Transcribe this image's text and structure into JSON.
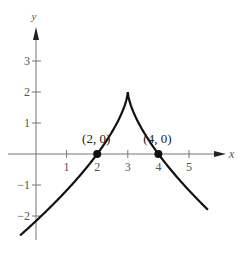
{
  "chart_data": {
    "type": "line",
    "title": "",
    "xlabel": "x",
    "ylabel": "y",
    "xlim": [
      -0.8,
      6.2
    ],
    "ylim": [
      -2.8,
      4
    ],
    "grid": false,
    "x_ticks": [
      1,
      2,
      3,
      4,
      5
    ],
    "x_tick_labels": [
      "1",
      "2",
      "3",
      "4",
      "5"
    ],
    "y_ticks": [
      3,
      2,
      1,
      -1,
      -2
    ],
    "y_tick_labels": [
      "3",
      "2",
      "1",
      "−1",
      "−2"
    ],
    "series": [
      {
        "name": "f(x)",
        "description": "cusp curve y = 2 - 2|x-3|^(2/3)",
        "x": [
          -0.5,
          0,
          0.5,
          1,
          1.5,
          2,
          2.5,
          2.8,
          3,
          3.2,
          3.5,
          4,
          4.5,
          5,
          5.6
        ],
        "y": [
          -2.61,
          -2.16,
          -1.68,
          -1.17,
          -0.62,
          0,
          0.74,
          1.32,
          2,
          1.32,
          0.74,
          0,
          -0.62,
          -1.17,
          -1.78
        ]
      }
    ],
    "points": [
      {
        "x": 2,
        "y": 0,
        "label": "(2, 0)"
      },
      {
        "x": 4,
        "y": 0,
        "label": "(4, 0)"
      }
    ]
  },
  "labels": {
    "x_axis": "x",
    "y_axis": "y",
    "point_a": "(2, 0)",
    "point_b": "(4, 0)"
  }
}
